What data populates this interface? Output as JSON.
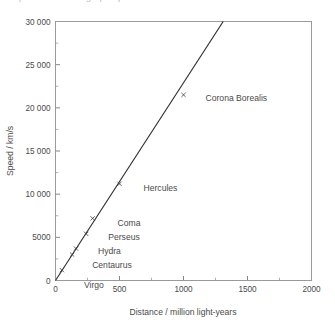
{
  "figure": {
    "cut_off_caption": "speed  .  distance  graph  .  plot",
    "background": "#ffffff",
    "line_color": "#2e2e2e",
    "axis_color": "#9a9a9a",
    "text_color": "#4a4a4a"
  },
  "chart_data": {
    "type": "scatter",
    "title": "",
    "xlabel": "Distance / million light-years",
    "ylabel": "Speed / km/s",
    "xlim": [
      0,
      2000
    ],
    "ylim": [
      0,
      30000
    ],
    "xticks": [
      0,
      500,
      1000,
      1500,
      2000
    ],
    "xtick_labels": [
      "0",
      "500",
      "1000",
      "1500",
      "2000"
    ],
    "xticks_minor": [
      250,
      750,
      1250,
      1750
    ],
    "yticks": [
      0,
      5000,
      10000,
      15000,
      20000,
      25000,
      30000
    ],
    "ytick_labels": [
      "0",
      "5000",
      "10 000",
      "15 000",
      "20 000",
      "25 000",
      "30 000"
    ],
    "yticks_minor": [
      2500,
      7500,
      12500,
      17500,
      22500,
      27500
    ],
    "grid": false,
    "legend": "none",
    "marker_style": "x",
    "points": [
      {
        "name": "Virgo",
        "x": 50,
        "y": 1200,
        "label_dx": 22,
        "label_dy": 18
      },
      {
        "name": "Centaurus",
        "x": 130,
        "y": 3000,
        "label_dx": 20,
        "label_dy": 13
      },
      {
        "name": "Hydra",
        "x": 160,
        "y": 3700,
        "label_dx": 22,
        "label_dy": 5
      },
      {
        "name": "Perseus",
        "x": 240,
        "y": 5400,
        "label_dx": 22,
        "label_dy": 6
      },
      {
        "name": "Coma",
        "x": 290,
        "y": 7200,
        "label_dx": 25,
        "label_dy": 8
      },
      {
        "name": "Hercules",
        "x": 500,
        "y": 11200,
        "label_dx": 24,
        "label_dy": 7
      },
      {
        "name": "Corona Borealis",
        "x": 1000,
        "y": 21500,
        "label_dx": 22,
        "label_dy": 6
      }
    ],
    "fit_line": {
      "description": "straight line of best fit through the origin",
      "x_start": 0,
      "y_start": 0,
      "x_end": 1310,
      "y_end": 30000,
      "slope_km_s_per_mly": 22.9
    }
  }
}
